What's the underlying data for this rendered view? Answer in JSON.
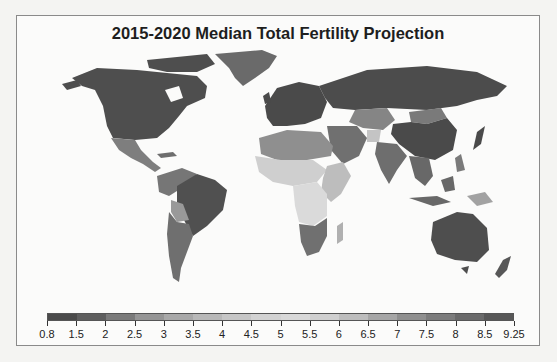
{
  "chart_data": {
    "type": "heatmap",
    "subtype": "choropleth-world-map",
    "title": "2015-2020 Median Total Fertility Projection",
    "xlabel": "",
    "ylabel": "",
    "colorbar": {
      "orientation": "horizontal",
      "position": "bottom",
      "range": [
        0.8,
        9.25
      ],
      "tick_labels": [
        "0.8",
        "1.5",
        "2",
        "2.5",
        "3",
        "3.5",
        "4",
        "4.5",
        "5",
        "5.5",
        "6",
        "6.5",
        "7",
        "7.5",
        "8",
        "8.5",
        "9.25"
      ],
      "tick_values": [
        0.8,
        1.5,
        2,
        2.5,
        3,
        3.5,
        4,
        4.5,
        5,
        5.5,
        6,
        6.5,
        7,
        7.5,
        8,
        8.5,
        9.25
      ],
      "colors": [
        "#4a4a4a",
        "#5e5e5e",
        "#7a7a7a",
        "#959595",
        "#a8a8a8",
        "#b8b8b8",
        "#c6c6c6",
        "#d2d2d2",
        "#d8d8d8",
        "#cfcfcf",
        "#bdbdbd",
        "#a6a6a6",
        "#8f8f8f",
        "#7c7c7c",
        "#6a6a6a",
        "#575757"
      ]
    },
    "regions": [
      {
        "name": "North America (USA/Canada)",
        "approx_value": 1.8,
        "shade": "#4e4e4e"
      },
      {
        "name": "Greenland",
        "approx_value": 2.0,
        "shade": "#6a6a6a"
      },
      {
        "name": "Mexico / Central America",
        "approx_value": 2.3,
        "shade": "#7e7e7e"
      },
      {
        "name": "Brazil",
        "approx_value": 1.7,
        "shade": "#505050"
      },
      {
        "name": "Andean South America",
        "approx_value": 2.4,
        "shade": "#767676"
      },
      {
        "name": "Bolivia",
        "approx_value": 2.9,
        "shade": "#999999"
      },
      {
        "name": "Argentina / Chile",
        "approx_value": 2.2,
        "shade": "#6f6f6f"
      },
      {
        "name": "Europe",
        "approx_value": 1.6,
        "shade": "#4a4a4a"
      },
      {
        "name": "Russia",
        "approx_value": 1.7,
        "shade": "#4c4c4c"
      },
      {
        "name": "Central Asia",
        "approx_value": 2.6,
        "shade": "#858585"
      },
      {
        "name": "China",
        "approx_value": 1.6,
        "shade": "#4a4a4a"
      },
      {
        "name": "Mongolia",
        "approx_value": 2.5,
        "shade": "#7a7a7a"
      },
      {
        "name": "India",
        "approx_value": 2.3,
        "shade": "#6e6e6e"
      },
      {
        "name": "Afghanistan",
        "approx_value": 4.5,
        "shade": "#c4c4c4"
      },
      {
        "name": "North Africa",
        "approx_value": 3.0,
        "shade": "#8f8f8f"
      },
      {
        "name": "Sahel / West Africa",
        "approx_value": 5.5,
        "shade": "#cfcfcf"
      },
      {
        "name": "Central Africa",
        "approx_value": 5.8,
        "shade": "#dadada"
      },
      {
        "name": "East Africa",
        "approx_value": 4.5,
        "shade": "#bdbdbd"
      },
      {
        "name": "Southern Africa",
        "approx_value": 2.4,
        "shade": "#707070"
      },
      {
        "name": "Madagascar",
        "approx_value": 4.0,
        "shade": "#b0b0b0"
      },
      {
        "name": "Southeast Asia",
        "approx_value": 2.2,
        "shade": "#686868"
      },
      {
        "name": "Papua New Guinea",
        "approx_value": 3.6,
        "shade": "#a2a2a2"
      },
      {
        "name": "Australia",
        "approx_value": 1.8,
        "shade": "#4e4e4e"
      },
      {
        "name": "New Zealand",
        "approx_value": 1.9,
        "shade": "#575757"
      }
    ],
    "grid": false,
    "legend_position": "bottom"
  }
}
